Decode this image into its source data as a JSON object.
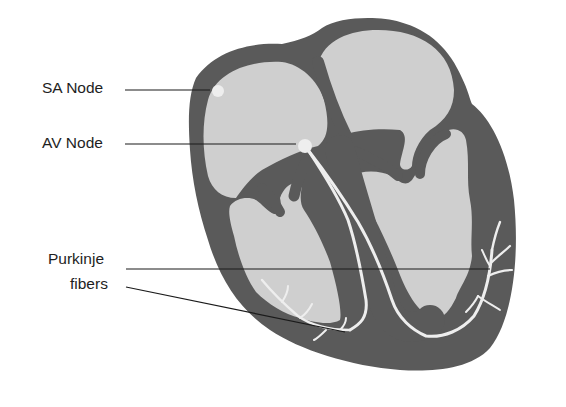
{
  "diagram": {
    "colors": {
      "background": "#ffffff",
      "myocardium": "#5a5a5a",
      "chamber": "#cfcfcf",
      "conduction": "#eeeeee",
      "leader_line": "#1a1a1a",
      "label_text": "#1e1e1e"
    },
    "labels": [
      {
        "id": "sa-node",
        "text": "SA Node",
        "x": 42,
        "y": 80,
        "target": [
          218,
          90
        ]
      },
      {
        "id": "av-node",
        "text": "AV Node",
        "x": 42,
        "y": 135,
        "target": [
          300,
          144
        ]
      },
      {
        "id": "purkinje-line1",
        "text": "Purkinje",
        "x": 48,
        "y": 251
      },
      {
        "id": "purkinje-line2",
        "text": "fibers",
        "x": 70,
        "y": 276
      }
    ],
    "purkinje_targets": [
      [
        490,
        269
      ],
      [
        345,
        332
      ]
    ]
  }
}
